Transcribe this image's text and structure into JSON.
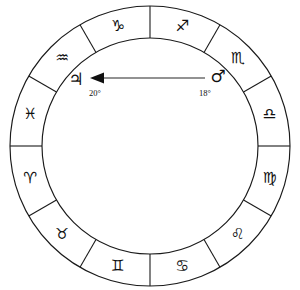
{
  "chart_data": {
    "type": "scatter",
    "title": "",
    "geometry": {
      "center_x": 150,
      "center_y": 146,
      "outer_radius": 140,
      "inner_radius": 108,
      "sector_count": 12,
      "sector_span_degrees": 30,
      "first_divider_angle_deg": 90,
      "grid": false,
      "legend": false
    },
    "colors": {
      "background": "#ffffff",
      "ring_stroke": "#1a1a1a",
      "glyph": "#101010",
      "arrow_shaft": "#6e6e6e",
      "arrow_head": "#101010"
    },
    "sectors": [
      {
        "name": "sagittarius",
        "glyph": "♐",
        "label": "Sagittarius",
        "mid_angle_deg": 75
      },
      {
        "name": "scorpio",
        "glyph": "♏",
        "label": "Scorpio",
        "mid_angle_deg": 45
      },
      {
        "name": "libra",
        "glyph": "♎",
        "label": "Libra",
        "mid_angle_deg": 15
      },
      {
        "name": "virgo",
        "glyph": "♍",
        "label": "Virgo",
        "mid_angle_deg": -15
      },
      {
        "name": "leo",
        "glyph": "♌",
        "label": "Leo",
        "mid_angle_deg": -45
      },
      {
        "name": "cancer",
        "glyph": "♋",
        "label": "Cancer",
        "mid_angle_deg": -75
      },
      {
        "name": "gemini",
        "glyph": "♊",
        "label": "Gemini",
        "mid_angle_deg": -105
      },
      {
        "name": "taurus",
        "glyph": "♉",
        "label": "Taurus",
        "mid_angle_deg": -135
      },
      {
        "name": "aries",
        "glyph": "♈",
        "label": "Aries",
        "mid_angle_deg": -165
      },
      {
        "name": "pisces",
        "glyph": "♓",
        "label": "Pisces",
        "mid_angle_deg": 165
      },
      {
        "name": "aquarius",
        "glyph": "♒",
        "label": "Aquarius",
        "mid_angle_deg": 135
      },
      {
        "name": "capricorn",
        "glyph": "♑",
        "label": "Capricorn",
        "mid_angle_deg": 105
      }
    ],
    "planets": [
      {
        "name": "jupiter",
        "glyph": "♃",
        "label": "Jupiter",
        "degree_label": "20°",
        "degree_value": 20,
        "x": 76,
        "y": 79,
        "degree_x": 95,
        "degree_y": 93
      },
      {
        "name": "mars",
        "glyph": "♂",
        "label": "Mars",
        "degree_label": "18°",
        "degree_value": 18,
        "x": 218,
        "y": 76,
        "degree_x": 205,
        "degree_y": 93
      }
    ],
    "aspect_arrow": {
      "name": "mars-to-jupiter-arrow",
      "from_planet": "mars",
      "to_planet": "jupiter",
      "direction": "left",
      "shaft_start_x": 205,
      "shaft_start_y": 78,
      "shaft_end_x": 99,
      "shaft_end_y": 78,
      "head_points": "90,78 104,72.5 104,83.5"
    }
  }
}
